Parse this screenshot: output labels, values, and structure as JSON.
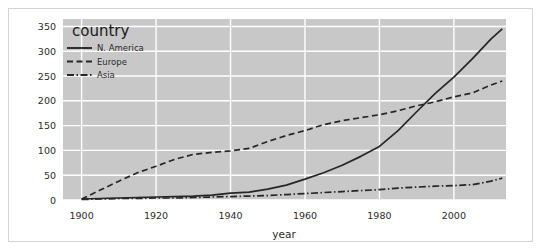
{
  "chart_data": {
    "type": "line",
    "title": "",
    "xlabel": "year",
    "ylabel": "",
    "legend_title": "country",
    "legend_position": "top-left-inside",
    "grid": true,
    "background_color": "#c8c8c8",
    "gridline_color": "#ffffff",
    "line_color": "#262626",
    "xlim": [
      1895,
      2014
    ],
    "ylim": [
      0,
      365
    ],
    "xticks": [
      1900,
      1920,
      1940,
      1960,
      1980,
      2000
    ],
    "yticks": [
      0,
      50,
      100,
      150,
      200,
      250,
      300,
      350
    ],
    "xtick_labels": [
      "1900",
      "1920",
      "1940",
      "1960",
      "1980",
      "2000"
    ],
    "ytick_labels": [
      "0",
      "50",
      "100",
      "150",
      "200",
      "250",
      "300",
      "350"
    ],
    "x": [
      1900,
      1905,
      1910,
      1915,
      1920,
      1925,
      1930,
      1935,
      1940,
      1945,
      1950,
      1955,
      1960,
      1965,
      1970,
      1975,
      1980,
      1985,
      1990,
      1995,
      2000,
      2005,
      2010,
      2013
    ],
    "series": [
      {
        "name": "N. America",
        "dash": "solid",
        "values": [
          2,
          3,
          4,
          5,
          6,
          7,
          8,
          10,
          14,
          16,
          22,
          30,
          42,
          55,
          70,
          88,
          108,
          140,
          178,
          215,
          248,
          285,
          325,
          345
        ]
      },
      {
        "name": "Europe",
        "dash": "dashed",
        "values": [
          2,
          20,
          38,
          55,
          68,
          82,
          92,
          96,
          99,
          104,
          118,
          130,
          140,
          152,
          160,
          166,
          172,
          180,
          190,
          198,
          208,
          216,
          232,
          240
        ]
      },
      {
        "name": "Asia",
        "dash": "dashdot",
        "values": [
          1,
          2,
          3,
          3,
          4,
          4,
          5,
          6,
          7,
          8,
          9,
          11,
          13,
          15,
          17,
          19,
          21,
          24,
          26,
          28,
          29,
          31,
          38,
          44
        ]
      }
    ]
  },
  "legend": {
    "title": "country",
    "entries": [
      {
        "label": "N. America",
        "dash": "solid"
      },
      {
        "label": "Europe",
        "dash": "dashed"
      },
      {
        "label": "Asia",
        "dash": "dashdot"
      }
    ]
  },
  "axes": {
    "x_title": "year",
    "y_title": ""
  }
}
